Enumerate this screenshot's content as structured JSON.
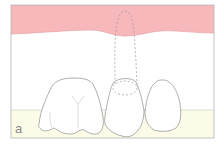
{
  "figure": {
    "panel_label": "a",
    "colors": {
      "gingiva": "#f7b8bb",
      "background": "#ffffff",
      "base": "#fbfbe8",
      "frame": "#b5b5b5",
      "tooth_outline": "#8c8c8c",
      "dashed_outline": "#9a9a9a",
      "label": "#8a8a8a"
    },
    "elements": [
      {
        "name": "gingiva",
        "description": "pink gum band along top"
      },
      {
        "name": "root-outline-dashed",
        "description": "dashed outline of hidden root extending into gum"
      },
      {
        "name": "molar",
        "description": "left tooth with fissure lines"
      },
      {
        "name": "premolar-middle",
        "description": "middle tooth with dashed ellipse at top"
      },
      {
        "name": "premolar-right",
        "description": "right rounded tooth"
      },
      {
        "name": "base-band",
        "description": "cream band at bottom"
      }
    ]
  }
}
